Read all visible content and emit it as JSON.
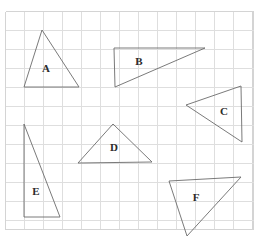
{
  "page": {
    "background_color": "#ffffff",
    "width": 277,
    "height": 244
  },
  "grid": {
    "name": "square-grid",
    "origin_x": 5,
    "origin_y": 11,
    "cell_size": 19,
    "columns": 13,
    "rows": 11.5,
    "right_edge": 253,
    "bottom_edge": 229,
    "line_color": "#dedede",
    "border_color": "#d4d4d4"
  },
  "chart_data": {
    "type": "scatter",
    "xlabel": "",
    "ylabel": "",
    "grid": true,
    "legend": "none"
  },
  "shapes": {
    "stroke_color": "#6b6b6b",
    "fill_color": "none",
    "label_color": "#2b2b2b",
    "items": [
      {
        "id": "triangle-a",
        "label": "A",
        "points": "42,30 24,87 79,87",
        "label_x": 46,
        "label_y": 69,
        "description": "isosceles triangle pointing up, left upper area"
      },
      {
        "id": "triangle-b",
        "label": "B",
        "points": "114,48 205,48 115,87",
        "label_x": 139,
        "label_y": 62,
        "description": "right triangle, horizontal top edge, upper right area"
      },
      {
        "id": "triangle-c",
        "label": "C",
        "points": "186,105 241,86 242,142",
        "label_x": 224,
        "label_y": 112,
        "description": "triangle pointing left, right middle area"
      },
      {
        "id": "triangle-d",
        "label": "D",
        "points": "113,124 78,163 152,162",
        "label_x": 114,
        "label_y": 148,
        "description": "wide isosceles triangle pointing up, center"
      },
      {
        "id": "triangle-e",
        "label": "E",
        "points": "24,124 24,217 60,217",
        "label_x": 36,
        "label_y": 192,
        "description": "tall right triangle, lower left area"
      },
      {
        "id": "triangle-f",
        "label": "F",
        "points": "169,181 241,177 187,236",
        "label_x": 196,
        "label_y": 198,
        "description": "triangle pointing down, lower right area"
      }
    ]
  }
}
